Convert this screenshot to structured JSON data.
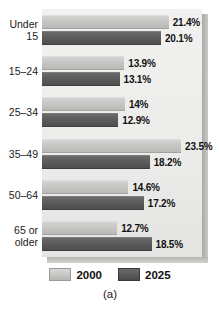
{
  "chart_data": {
    "type": "bar",
    "orientation": "horizontal",
    "title": "",
    "subtitle": "",
    "xlabel": "",
    "ylabel": "",
    "caption": "(a)",
    "grid": false,
    "legend_position": "bottom",
    "xlim": [
      0,
      25
    ],
    "value_suffix": "%",
    "categories": [
      "Under\n15",
      "15–24",
      "25–34",
      "35–49",
      "50–64",
      "65 or\nolder"
    ],
    "series": [
      {
        "name": "2000",
        "color": "#c6c6c4",
        "values": [
          21.4,
          13.9,
          14,
          14.6,
          23.5,
          12.7
        ]
      },
      {
        "name": "2025",
        "color": "#5a5a5a",
        "values": [
          20.1,
          13.1,
          12.9,
          18.2,
          17.2,
          18.5
        ]
      }
    ],
    "groups": [
      {
        "category": "Under\n15",
        "bars": [
          {
            "series": "2000",
            "value": 21.4,
            "label": "21.4%"
          },
          {
            "series": "2025",
            "value": 20.1,
            "label": "20.1%"
          }
        ]
      },
      {
        "category": "15–24",
        "bars": [
          {
            "series": "2000",
            "value": 13.9,
            "label": "13.9%"
          },
          {
            "series": "2025",
            "value": 13.1,
            "label": "13.1%"
          }
        ]
      },
      {
        "category": "25–34",
        "bars": [
          {
            "series": "2000",
            "value": 14,
            "label": "14%"
          },
          {
            "series": "2025",
            "value": 12.9,
            "label": "12.9%"
          }
        ]
      },
      {
        "category": "35–49",
        "bars": [
          {
            "series": "2000",
            "value": 23.5,
            "label": "23.5%"
          },
          {
            "series": "2025",
            "value": 18.2,
            "label": "18.2%"
          }
        ]
      },
      {
        "category": "50–64",
        "bars": [
          {
            "series": "2000",
            "value": 14.6,
            "label": "14.6%"
          },
          {
            "series": "2025",
            "value": 17.2,
            "label": "17.2%"
          }
        ]
      },
      {
        "category": "65 or\nolder",
        "bars": [
          {
            "series": "2000",
            "value": 12.7,
            "label": "12.7%"
          },
          {
            "series": "2025",
            "value": 18.5,
            "label": "18.5%"
          }
        ]
      }
    ],
    "legend": [
      {
        "label": "2000",
        "color": "#c6c6c4"
      },
      {
        "label": "2025",
        "color": "#5a5a5a"
      }
    ]
  }
}
